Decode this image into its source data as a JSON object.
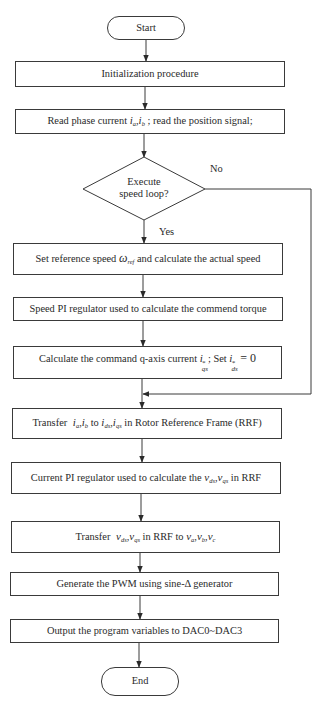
{
  "diagram": {
    "type": "flowchart",
    "colors": {
      "stroke": "#3a3a3a",
      "text": "#2a2a2a",
      "background": "#ffffff"
    },
    "start": {
      "label": "Start"
    },
    "end": {
      "label": "End"
    },
    "steps": [
      {
        "id": "init",
        "label": "Initialization procedure"
      },
      {
        "id": "read",
        "pre": "Read phase current",
        "vars": [
          "i_a",
          "i_b"
        ],
        "post": "; read the position signal;"
      },
      {
        "id": "setref",
        "pre": "Set reference speed",
        "var": "ω_ref",
        "post": "and calculate the actual speed"
      },
      {
        "id": "speedpi",
        "label": "Speed PI regulator used to calculate the commend torque"
      },
      {
        "id": "calciq",
        "pre": "Calculate the command q-axis current",
        "var1": "i*_qs",
        "mid": "; Set",
        "var2": "i*_ds",
        "post": "= 0"
      },
      {
        "id": "transfer1",
        "pre": "Transfer",
        "vars1": "i_a , i_b",
        "mid": "to",
        "vars2": "i_ds , i_qs",
        "post": "in Rotor Reference Frame (RRF)"
      },
      {
        "id": "currentpi",
        "pre": "Current PI regulator used to calculate the",
        "vars": "v_ds , v_qs",
        "post": "in RRF"
      },
      {
        "id": "transfer2",
        "pre": "Transfer",
        "vars1": "v_ds , v_qs",
        "mid": "in RRF to",
        "vars2": "v_a , v_b , v_c"
      },
      {
        "id": "pwm",
        "label": "Generate the PWM using sine-Δ generator"
      },
      {
        "id": "dac",
        "label": "Output the program variables to DAC0~DAC3"
      }
    ],
    "decision": {
      "line1": "Execute",
      "line2": "speed loop?",
      "yes_label": "Yes",
      "no_label": "No"
    },
    "text": {
      "read_pre": "Read phase current",
      "read_post": "; read the position signal;",
      "setref_pre": "Set reference speed",
      "setref_post": "and calculate the actual speed",
      "calciq_pre": "Calculate the command q-axis current",
      "calciq_mid": "; Set",
      "calciq_post": "= 0",
      "t1_pre": "Transfer",
      "t1_mid": "to",
      "t1_post": "in Rotor Reference Frame (RRF)",
      "cpi_pre": "Current PI regulator used to calculate the",
      "cpi_post": "in RRF",
      "t2_pre": "Transfer",
      "t2_mid": "in RRF to",
      "sym": {
        "i": "i",
        "v": "v",
        "omega": "ω",
        "a": "a",
        "b": "b",
        "c": "c",
        "ref": "ref",
        "ds": "ds",
        "qs": "qs",
        "star": "*",
        "comma": ","
      }
    }
  }
}
